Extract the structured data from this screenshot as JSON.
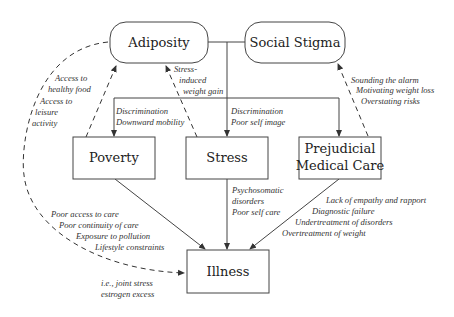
{
  "nodes": {
    "adiposity": "Adiposity",
    "social_stigma": "Social Stigma",
    "poverty": "Poverty",
    "stress": "Stress",
    "prejudicial_1": "Prejudicial",
    "prejudicial_2": "Medical Care",
    "illness": "Illness"
  },
  "edge_labels": {
    "access_food_1": "Access to",
    "access_food_2": "healthy food",
    "access_leisure_1": "Access to",
    "access_leisure_2": "leisure",
    "access_leisure_3": "activity",
    "stress_weight_1": "Stress-",
    "stress_weight_2": "induced",
    "stress_weight_3": "weight gain",
    "poverty_disc_1": "Discrimination",
    "poverty_disc_2": "Downward mobility",
    "stress_disc_1": "Discrimination",
    "stress_disc_2": "Poor self image",
    "alarm_1": "Sounding the alarm",
    "alarm_2": "Motivating weight loss",
    "alarm_3": "Overstating risks",
    "psych_1": "Psychosomatic",
    "psych_2": "disorders",
    "psych_3": "Poor self care",
    "poverty_ill_1": "Poor access to care",
    "poverty_ill_2": "Poor continuity of care",
    "poverty_ill_3": "Exposure to pollution",
    "poverty_ill_4": "Lifestyle constraints",
    "medical_ill_1": "Lack of empathy and rapport",
    "medical_ill_2": "Diagnostic failure",
    "medical_ill_3": "Undertreatment of disorders",
    "medical_ill_4": "Overtreatment of weight",
    "adip_ill_1": "i.e., joint stress",
    "adip_ill_2": "estrogen excess"
  }
}
